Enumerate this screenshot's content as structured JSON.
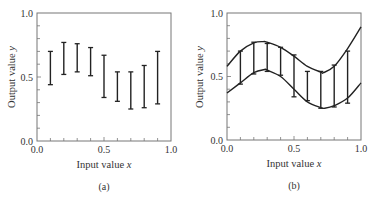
{
  "chart_data": [
    {
      "panel": "(a)",
      "type": "errorbar",
      "xlabel": "Input value x",
      "ylabel": "Output value y",
      "xlim": [
        0.0,
        1.0
      ],
      "ylim": [
        0.0,
        1.0
      ],
      "xticks": [
        "0.0",
        "0.5",
        "1.0"
      ],
      "yticks": [
        "0.0",
        "0.5",
        "1.0"
      ],
      "grid": false,
      "x": [
        0.1,
        0.2,
        0.3,
        0.4,
        0.5,
        0.6,
        0.7,
        0.8,
        0.9
      ],
      "lower": [
        0.44,
        0.52,
        0.54,
        0.51,
        0.34,
        0.31,
        0.25,
        0.26,
        0.29
      ],
      "upper": [
        0.7,
        0.77,
        0.76,
        0.73,
        0.67,
        0.54,
        0.54,
        0.59,
        0.7
      ]
    },
    {
      "panel": "(b)",
      "type": "errorbar+line",
      "xlabel": "Input value x",
      "ylabel": "Output value y",
      "xlim": [
        0.0,
        1.0
      ],
      "ylim": [
        0.0,
        1.0
      ],
      "xticks": [
        "0.0",
        "0.5",
        "1.0"
      ],
      "yticks": [
        "0.0",
        "0.5",
        "1.0"
      ],
      "grid": false,
      "x": [
        0.1,
        0.2,
        0.3,
        0.4,
        0.5,
        0.6,
        0.7,
        0.8,
        0.9
      ],
      "lower": [
        0.44,
        0.52,
        0.54,
        0.51,
        0.34,
        0.31,
        0.25,
        0.26,
        0.29
      ],
      "upper": [
        0.7,
        0.77,
        0.76,
        0.73,
        0.67,
        0.54,
        0.54,
        0.59,
        0.7
      ],
      "series": [
        {
          "name": "upper envelope",
          "x": [
            0.0,
            0.1,
            0.2,
            0.27,
            0.3,
            0.4,
            0.5,
            0.6,
            0.7,
            0.72,
            0.8,
            0.9,
            1.0
          ],
          "values": [
            0.58,
            0.7,
            0.765,
            0.775,
            0.77,
            0.73,
            0.66,
            0.58,
            0.535,
            0.53,
            0.58,
            0.72,
            0.89
          ]
        },
        {
          "name": "lower envelope",
          "x": [
            0.0,
            0.1,
            0.2,
            0.28,
            0.3,
            0.4,
            0.5,
            0.6,
            0.7,
            0.73,
            0.8,
            0.9,
            1.0
          ],
          "values": [
            0.37,
            0.45,
            0.53,
            0.555,
            0.55,
            0.5,
            0.4,
            0.3,
            0.255,
            0.25,
            0.27,
            0.33,
            0.45
          ]
        }
      ]
    }
  ],
  "panels": {
    "a": {
      "label": "(a)",
      "xlabel": "Input value x",
      "ylabel": "Output value y",
      "xticks": [
        "0.0",
        "0.5",
        "1.0"
      ],
      "yticks": [
        "0.0",
        "0.5",
        "1.0"
      ]
    },
    "b": {
      "label": "(b)",
      "xlabel": "Input value x",
      "ylabel": "Output value y",
      "xticks": [
        "0.0",
        "0.5",
        "1.0"
      ],
      "yticks": [
        "0.0",
        "0.5",
        "1.0"
      ]
    }
  },
  "colors": {
    "ink": "#222222",
    "frame": "#777777",
    "background": "#ffffff"
  }
}
